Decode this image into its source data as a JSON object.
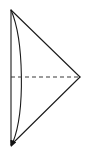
{
  "figure": {
    "name": "cone-side-view-diagram",
    "type": "geometric-line-diagram",
    "canvas": {
      "width": 89,
      "height": 154,
      "background": "#ffffff"
    },
    "stroke": {
      "solid_color": "#1a1a1a",
      "solid_width": 1.1,
      "dashed_color": "#3b3b3b",
      "dashed_width": 1.1,
      "dash_pattern": "4 3"
    },
    "points": {
      "apex_right": {
        "x": 80,
        "y": 77,
        "label": ""
      },
      "base_top": {
        "x": 11,
        "y": 10,
        "label": ""
      },
      "base_bottom": {
        "x": 11,
        "y": 145,
        "label": ""
      },
      "base_center": {
        "x": 11,
        "y": 77,
        "label": ""
      },
      "arc_bulge": {
        "x": 25,
        "y": 77,
        "label": ""
      },
      "arrow_tip": {
        "x": 12,
        "y": 143,
        "label": ""
      }
    },
    "elements": [
      {
        "name": "base-vertical-line",
        "kind": "line",
        "description": "straight vertical base edge on the left",
        "path": "M 11 10 L 11 145",
        "style": "solid"
      },
      {
        "name": "upper-slant-line",
        "kind": "line",
        "description": "slant edge from base top to right apex",
        "path": "M 11 10 L 80 77",
        "style": "solid"
      },
      {
        "name": "lower-slant-line",
        "kind": "line",
        "description": "slant edge from base bottom to right apex",
        "path": "M 11 145 L 80 77",
        "style": "solid"
      },
      {
        "name": "base-ellipse-arc",
        "kind": "curve",
        "description": "curved base rim bulging to the right, drawn from base top to base bottom with a directional arrowhead at its lower end",
        "path": "M 11 10 C 24 40, 25 112, 13 142",
        "style": "solid",
        "arrowhead": "filled-triangle-at-end"
      },
      {
        "name": "axis-dashed-line",
        "kind": "line",
        "description": "horizontal dashed axis from base center to right apex",
        "path": "M 11 77 L 79 77",
        "style": "dashed"
      }
    ],
    "annotations": [],
    "labels": []
  }
}
